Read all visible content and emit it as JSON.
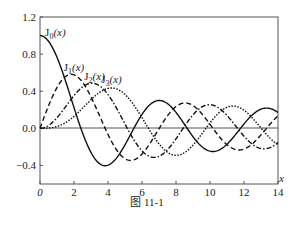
{
  "chart_data": {
    "type": "line",
    "title": "",
    "caption": "图 11-1",
    "xlabel": "x",
    "ylabel": "",
    "xlim": [
      0,
      14
    ],
    "ylim": [
      -0.6,
      1.2
    ],
    "xticks": [
      0,
      2,
      4,
      6,
      8,
      10,
      12,
      14
    ],
    "xtick_labels": [
      "0",
      "2",
      "4",
      "6",
      "8",
      "10",
      "12",
      "14"
    ],
    "yticks": [
      -0.4,
      0.0,
      0.4,
      0.8,
      1.2
    ],
    "ytick_labels": [
      "−0.4",
      "0.0",
      "0.4",
      "0.8",
      "1.2"
    ],
    "grid": false,
    "zero_line": true,
    "x": [
      0,
      1,
      2,
      3,
      4,
      5,
      6,
      7,
      8,
      9,
      10,
      11,
      12,
      13,
      14
    ],
    "series": [
      {
        "name": "J0(x)",
        "order": 0,
        "style": "solid",
        "values": [
          1.0,
          0.765,
          0.224,
          -0.26,
          -0.397,
          -0.178,
          0.151,
          0.3,
          0.172,
          -0.09,
          -0.246,
          -0.171,
          0.048,
          0.207,
          0.171
        ]
      },
      {
        "name": "J1(x)",
        "order": 1,
        "style": "dashed",
        "values": [
          0.0,
          0.44,
          0.577,
          0.339,
          -0.066,
          -0.328,
          -0.277,
          -0.005,
          0.235,
          0.245,
          0.043,
          -0.177,
          -0.223,
          -0.07,
          0.133
        ]
      },
      {
        "name": "J2(x)",
        "order": 2,
        "style": "dash-dot",
        "values": [
          0.0,
          0.115,
          0.353,
          0.486,
          0.364,
          0.047,
          -0.243,
          -0.301,
          -0.113,
          0.145,
          0.255,
          0.139,
          -0.085,
          -0.218,
          -0.152
        ]
      },
      {
        "name": "J3(x)",
        "order": 3,
        "style": "dotted",
        "values": [
          0.0,
          0.02,
          0.129,
          0.309,
          0.43,
          0.365,
          0.115,
          -0.168,
          -0.291,
          -0.181,
          0.058,
          0.227,
          0.195,
          -0.003,
          -0.177
        ]
      }
    ],
    "annotations": [
      {
        "series": "J0(x)",
        "text_main": "J",
        "text_sub": "0",
        "text_tail": "(x)",
        "at": [
          0.3,
          1.0
        ]
      },
      {
        "series": "J1(x)",
        "text_main": "J",
        "text_sub": "1",
        "text_tail": "(x)",
        "at": [
          1.4,
          0.62
        ]
      },
      {
        "series": "J2(x)",
        "text_main": "J",
        "text_sub": "2",
        "text_tail": "(x)",
        "at": [
          2.6,
          0.52
        ]
      },
      {
        "series": "J3(x)",
        "text_main": "J",
        "text_sub": "3",
        "text_tail": "(x)",
        "at": [
          3.6,
          0.49
        ]
      }
    ]
  }
}
